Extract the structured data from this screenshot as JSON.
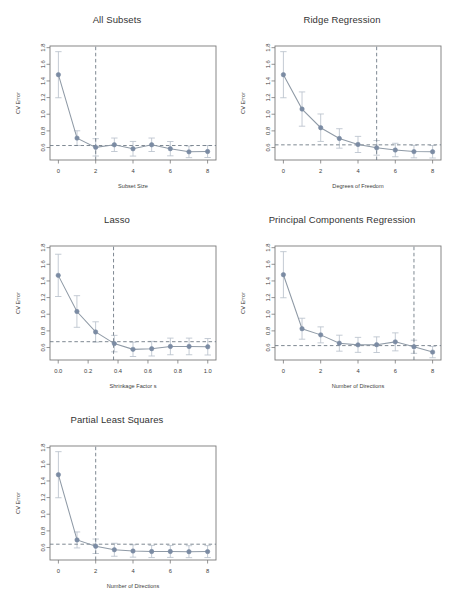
{
  "figure": {
    "background": "#ffffff",
    "point_color": "#7b8ba3",
    "line_color": "#8f9aa6",
    "errorbar_color": "#b9c2cc",
    "axis_color": "#7a7a7a",
    "dashed_color": "#6f7b86",
    "title_color": "#333333"
  },
  "chart_data": [
    {
      "type": "line",
      "id": "all-subsets",
      "title": "All Subsets",
      "xlabel": "Subset Size",
      "ylabel": "CV Error",
      "xlim": [
        -0.45,
        8.45
      ],
      "ylim": [
        0.45,
        1.82
      ],
      "xticks": [
        0,
        2,
        4,
        6,
        8
      ],
      "xticklabels": [
        "0",
        "2",
        "4",
        "6",
        "8"
      ],
      "yticks": [
        0.6,
        0.8,
        1.0,
        1.2,
        1.4,
        1.6,
        1.8
      ],
      "yticklabels": [
        "0.6",
        "0.8",
        "1.0",
        "1.2",
        "1.4",
        "1.6",
        "1.8"
      ],
      "grid": false,
      "legend": "none",
      "x": [
        0,
        1,
        2,
        3,
        4,
        5,
        6,
        7,
        8
      ],
      "values": [
        1.475,
        0.713,
        0.602,
        0.633,
        0.585,
        0.633,
        0.586,
        0.548,
        0.552
      ],
      "err_low": [
        1.198,
        0.625,
        0.498,
        0.552,
        0.497,
        0.552,
        0.5,
        0.478,
        0.48
      ],
      "err_high": [
        1.752,
        0.801,
        0.706,
        0.714,
        0.673,
        0.714,
        0.672,
        0.618,
        0.624
      ],
      "hline": 0.624,
      "vline": 2,
      "vline_label": "selected model: subset size 2"
    },
    {
      "type": "line",
      "id": "ridge-regression",
      "title": "Ridge Regression",
      "xlabel": "Degrees of Freedom",
      "ylabel": "CV Error",
      "xlim": [
        -0.45,
        8.45
      ],
      "ylim": [
        0.45,
        1.82
      ],
      "xticks": [
        0,
        2,
        4,
        6,
        8
      ],
      "xticklabels": [
        "0",
        "2",
        "4",
        "6",
        "8"
      ],
      "yticks": [
        0.6,
        0.8,
        1.0,
        1.2,
        1.4,
        1.6,
        1.8
      ],
      "yticklabels": [
        "0.6",
        "0.8",
        "1.0",
        "1.2",
        "1.4",
        "1.6",
        "1.8"
      ],
      "grid": false,
      "legend": "none",
      "x": [
        0,
        1,
        2,
        3,
        4,
        5,
        6,
        7,
        8
      ],
      "values": [
        1.475,
        1.062,
        0.838,
        0.709,
        0.637,
        0.596,
        0.57,
        0.551,
        0.549
      ],
      "err_low": [
        1.198,
        0.856,
        0.673,
        0.592,
        0.54,
        0.508,
        0.489,
        0.476,
        0.474
      ],
      "err_high": [
        1.752,
        1.268,
        1.003,
        0.826,
        0.734,
        0.684,
        0.651,
        0.626,
        0.624
      ],
      "hline": 0.632,
      "vline": 5,
      "vline_label": "selected model: 5 degrees of freedom"
    },
    {
      "type": "line",
      "id": "lasso",
      "title": "Lasso",
      "xlabel": "Shrinkage Factor s",
      "ylabel": "CV Error",
      "xlim": [
        -0.055,
        1.055
      ],
      "ylim": [
        0.45,
        1.82
      ],
      "xticks": [
        0.0,
        0.2,
        0.4,
        0.6,
        0.8,
        1.0
      ],
      "xticklabels": [
        "0.0",
        "0.2",
        "0.4",
        "0.6",
        "0.8",
        "1.0"
      ],
      "yticks": [
        0.6,
        0.8,
        1.0,
        1.2,
        1.4,
        1.6,
        1.8
      ],
      "yticklabels": [
        "0.6",
        "0.8",
        "1.0",
        "1.2",
        "1.4",
        "1.6",
        "1.8"
      ],
      "grid": false,
      "legend": "none",
      "x": [
        0.0,
        0.125,
        0.25,
        0.375,
        0.5,
        0.625,
        0.75,
        0.875,
        1.0
      ],
      "values": [
        1.467,
        1.033,
        0.787,
        0.647,
        0.578,
        0.586,
        0.613,
        0.613,
        0.609
      ],
      "err_low": [
        1.213,
        0.843,
        0.665,
        0.548,
        0.492,
        0.498,
        0.513,
        0.513,
        0.51
      ],
      "err_high": [
        1.721,
        1.223,
        0.909,
        0.746,
        0.664,
        0.674,
        0.713,
        0.713,
        0.708
      ],
      "hline": 0.67,
      "vline": 0.37,
      "vline_label": "selected model: shrinkage factor 0.37"
    },
    {
      "type": "line",
      "id": "principal-components-regression",
      "title": "Principal Components Regression",
      "xlabel": "Number of Directions",
      "ylabel": "CV Error",
      "xlim": [
        -0.45,
        8.45
      ],
      "ylim": [
        0.45,
        1.82
      ],
      "xticks": [
        0,
        2,
        4,
        6,
        8
      ],
      "xticklabels": [
        "0",
        "2",
        "4",
        "6",
        "8"
      ],
      "yticks": [
        0.6,
        0.8,
        1.0,
        1.2,
        1.4,
        1.6,
        1.8
      ],
      "yticklabels": [
        "0.6",
        "0.8",
        "1.0",
        "1.2",
        "1.4",
        "1.6",
        "1.8"
      ],
      "grid": false,
      "legend": "none",
      "x": [
        0,
        1,
        2,
        3,
        4,
        5,
        6,
        7,
        8
      ],
      "values": [
        1.475,
        0.826,
        0.752,
        0.652,
        0.632,
        0.634,
        0.668,
        0.609,
        0.545
      ],
      "err_low": [
        1.198,
        0.7,
        0.656,
        0.556,
        0.542,
        0.54,
        0.56,
        0.53,
        0.477
      ],
      "err_high": [
        1.752,
        0.952,
        0.848,
        0.748,
        0.722,
        0.728,
        0.776,
        0.688,
        0.613
      ],
      "hline": 0.623,
      "vline": 7,
      "vline_label": "selected model: 7 directions"
    },
    {
      "type": "line",
      "id": "partial-least-squares",
      "title": "Partial Least Squares",
      "xlabel": "Number of  Directions",
      "ylabel": "CV Error",
      "xlim": [
        -0.45,
        8.45
      ],
      "ylim": [
        0.45,
        1.82
      ],
      "xticks": [
        0,
        2,
        4,
        6,
        8
      ],
      "xticklabels": [
        "0",
        "2",
        "4",
        "6",
        "8"
      ],
      "yticks": [
        0.6,
        0.8,
        1.0,
        1.2,
        1.4,
        1.6,
        1.8
      ],
      "yticklabels": [
        "0.6",
        "0.8",
        "1.0",
        "1.2",
        "1.4",
        "1.6",
        "1.8"
      ],
      "grid": false,
      "legend": "none",
      "x": [
        0,
        1,
        2,
        3,
        4,
        5,
        6,
        7,
        8
      ],
      "values": [
        1.475,
        0.691,
        0.615,
        0.573,
        0.558,
        0.552,
        0.553,
        0.55,
        0.551
      ],
      "err_low": [
        1.198,
        0.595,
        0.528,
        0.495,
        0.484,
        0.479,
        0.481,
        0.478,
        0.479
      ],
      "err_high": [
        1.752,
        0.787,
        0.702,
        0.651,
        0.632,
        0.625,
        0.625,
        0.622,
        0.623
      ],
      "hline": 0.64,
      "vline": 2,
      "vline_label": "selected model: 2 directions"
    }
  ],
  "panels": [
    {
      "id": "all-subsets",
      "left": 6,
      "top": 14,
      "width": 222,
      "height": 196
    },
    {
      "id": "ridge-regression",
      "left": 231,
      "top": 14,
      "width": 222,
      "height": 196
    },
    {
      "id": "lasso",
      "left": 6,
      "top": 214,
      "width": 222,
      "height": 196
    },
    {
      "id": "principal-components-regression",
      "left": 231,
      "top": 214,
      "width": 222,
      "height": 196
    },
    {
      "id": "partial-least-squares",
      "left": 6,
      "top": 414,
      "width": 222,
      "height": 196
    }
  ]
}
